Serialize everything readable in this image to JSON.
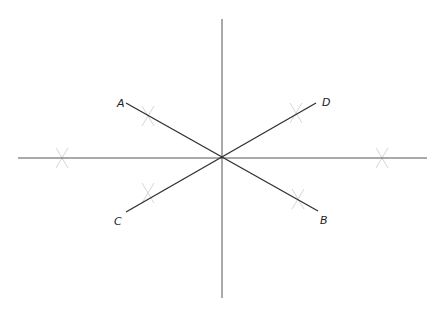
{
  "diagram": {
    "type": "geometric-construction",
    "center": {
      "x": 222,
      "y": 158
    },
    "axes": {
      "horizontal": {
        "x1": 18,
        "y1": 158,
        "x2": 427,
        "y2": 158
      },
      "vertical": {
        "x1": 222,
        "y1": 19,
        "x2": 222,
        "y2": 298
      }
    },
    "segments": [
      {
        "name": "AB",
        "from": "A",
        "to": "B",
        "x1": 126,
        "y1": 103,
        "x2": 318,
        "y2": 211
      },
      {
        "name": "CD",
        "from": "C",
        "to": "D",
        "x1": 126,
        "y1": 212,
        "x2": 316,
        "y2": 103
      }
    ],
    "points": [
      {
        "label": "A",
        "x": 117,
        "y": 107
      },
      {
        "label": "D",
        "x": 322,
        "y": 106
      },
      {
        "label": "C",
        "x": 114,
        "y": 225
      },
      {
        "label": "B",
        "x": 320,
        "y": 224
      }
    ],
    "construction_marks": [
      {
        "x": 148,
        "y": 116
      },
      {
        "x": 296,
        "y": 113
      },
      {
        "x": 148,
        "y": 193
      },
      {
        "x": 298,
        "y": 199
      },
      {
        "x": 62,
        "y": 158
      },
      {
        "x": 382,
        "y": 158
      }
    ]
  }
}
